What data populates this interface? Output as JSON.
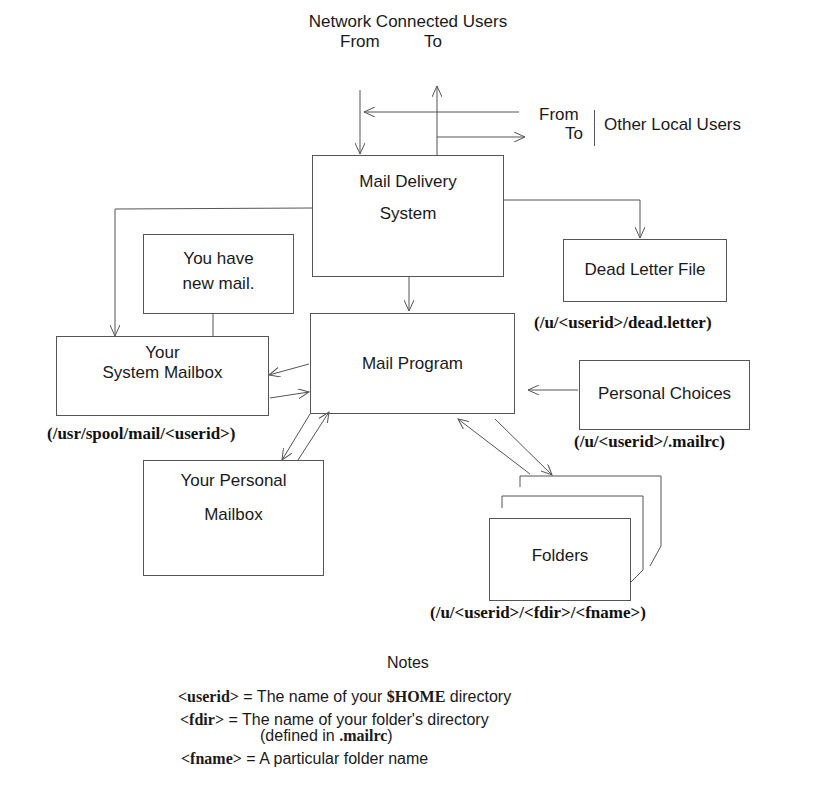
{
  "diagram": {
    "top": {
      "network_title": "Network Connected Users",
      "network_from": "From",
      "network_to": "To",
      "local_from": "From",
      "local_to": "To",
      "local_title": "Other Local Users"
    },
    "nodes": {
      "mail_delivery": {
        "line1": "Mail Delivery",
        "line2": "System"
      },
      "new_mail": {
        "line1": "You have",
        "line2": "new mail."
      },
      "dead_letter": {
        "label": "Dead Letter File",
        "path": "(/u/<userid>/dead.letter)"
      },
      "system_mailbox": {
        "line1": "Your",
        "line2": "System Mailbox",
        "path": "(/usr/spool/mail/<userid>)"
      },
      "mail_program": {
        "label": "Mail Program"
      },
      "personal_choices": {
        "label": "Personal Choices",
        "path": "(/u/<userid>/.mailrc)"
      },
      "personal_mailbox": {
        "line1": "Your Personal",
        "line2": "Mailbox"
      },
      "folders": {
        "label": "Folders",
        "path": "(/u/<userid>/<fdir>/<fname>)"
      }
    },
    "edges": [
      {
        "from": "Network Connected Users",
        "to": "Mail Delivery System"
      },
      {
        "from": "Mail Delivery System",
        "to": "Network Connected Users"
      },
      {
        "from": "Other Local Users",
        "to": "Mail Delivery System"
      },
      {
        "from": "Mail Delivery System",
        "to": "Other Local Users"
      },
      {
        "from": "Mail Delivery System",
        "to": "Your System Mailbox"
      },
      {
        "from": "Mail Delivery System",
        "to": "Dead Letter File"
      },
      {
        "from": "Mail Delivery System",
        "to": "Mail Program"
      },
      {
        "from": "Mail Program",
        "to": "Your System Mailbox"
      },
      {
        "from": "Your System Mailbox",
        "to": "Mail Program"
      },
      {
        "from": "Mail Program",
        "to": "Your Personal Mailbox"
      },
      {
        "from": "Your Personal Mailbox",
        "to": "Mail Program"
      },
      {
        "from": "Personal Choices",
        "to": "Mail Program"
      },
      {
        "from": "Mail Program",
        "to": "Folders"
      },
      {
        "from": "Folders",
        "to": "Mail Program"
      }
    ]
  },
  "notes": {
    "title": "Notes",
    "items": [
      {
        "term": "<userid>",
        "eq": " = The name of your ",
        "bold": "$HOME",
        "rest": " directory"
      },
      {
        "term": "<fdir>",
        "eq": " = The name of your folder's directory"
      },
      {
        "sub_prefix": "(defined in ",
        "sub_bold": ".mailrc",
        "sub_suffix": ")"
      },
      {
        "term": "<fname>",
        "eq": " = A particular folder name"
      }
    ]
  },
  "colors": {
    "line": "#555555",
    "text": "#1a1a1a",
    "background": "#ffffff"
  }
}
